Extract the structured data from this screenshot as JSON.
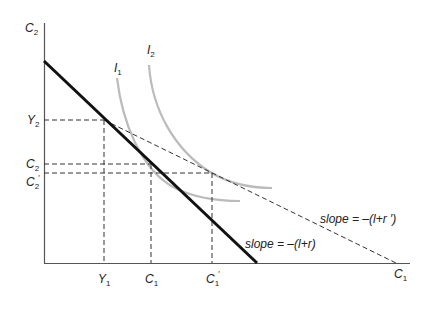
{
  "diagram": {
    "type": "intertemporal-budget-constraint",
    "axes": {
      "y_label": {
        "main": "C",
        "sub": "2"
      },
      "x_label": {
        "main": "C",
        "sub": "1"
      }
    },
    "y_ticks": [
      {
        "main": "Y",
        "sub": "2",
        "prime": ""
      },
      {
        "main": "C",
        "sub": "2",
        "prime": ""
      },
      {
        "main": "C",
        "sub": "2",
        "prime": "′"
      }
    ],
    "x_ticks": [
      {
        "main": "Y",
        "sub": "1",
        "prime": ""
      },
      {
        "main": "C",
        "sub": "1",
        "prime": ""
      },
      {
        "main": "C",
        "sub": "1",
        "prime": "′"
      }
    ],
    "curves": [
      {
        "main": "I",
        "sub": "1"
      },
      {
        "main": "I",
        "sub": "2"
      }
    ],
    "lines": {
      "original": {
        "label": "slope = –(l+r)"
      },
      "new": {
        "label": "slope = –(l+r ′)"
      }
    },
    "colors": {
      "axis": "#555555",
      "budget_line": "#111111",
      "dashed": "#333333",
      "indifference": "#bbbbbb"
    }
  }
}
